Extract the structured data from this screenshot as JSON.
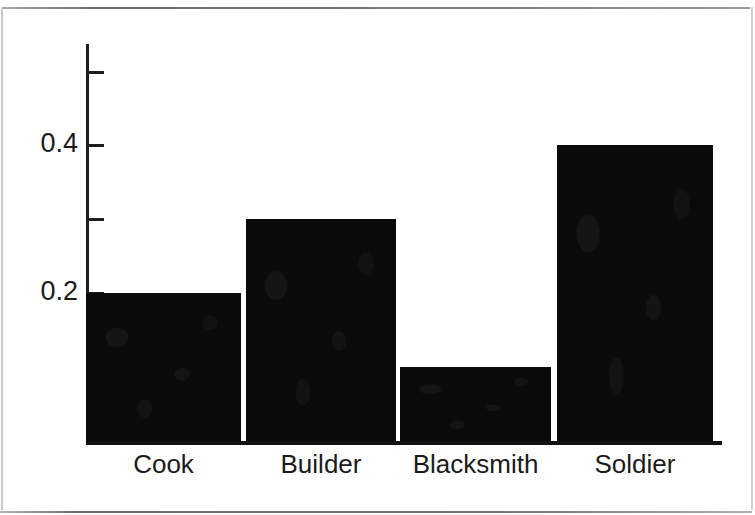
{
  "figure": {
    "background_color": "#ffffff",
    "ink_color": "#0a0a0a",
    "axis_color": "#1d1d1d",
    "page_rule_color": "#8d8d8d"
  },
  "chart_data": {
    "type": "bar",
    "title": "",
    "xlabel": "",
    "ylabel": "",
    "categories": [
      "Cook",
      "Builder",
      "Blacksmith",
      "Soldier"
    ],
    "values": [
      0.2,
      0.3,
      0.1,
      0.4
    ],
    "ylim": [
      0.0,
      0.52
    ],
    "y_ticks": [
      0.2,
      0.3,
      0.4,
      0.5
    ],
    "y_tick_labels": [
      "0.2",
      "",
      "0.4",
      ""
    ],
    "grid": false,
    "legend": null,
    "bar_color": "#0a0a0a",
    "orientation": "vertical"
  },
  "axis": {
    "y_labels": [
      {
        "text": "0.4",
        "value": 0.4
      },
      {
        "text": "0.2",
        "value": 0.2
      }
    ],
    "y_tick_values": [
      0.5,
      0.4,
      0.3,
      0.2
    ]
  },
  "bars": [
    {
      "label": "Cook",
      "value": 0.2
    },
    {
      "label": "Builder",
      "value": 0.3
    },
    {
      "label": "Blacksmith",
      "value": 0.1
    },
    {
      "label": "Soldier",
      "value": 0.4
    }
  ]
}
